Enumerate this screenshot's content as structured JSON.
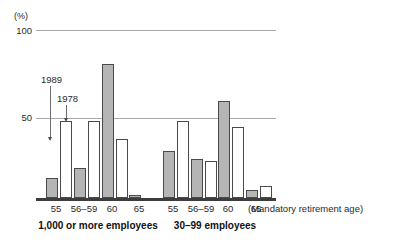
{
  "chart_data": {
    "type": "bar",
    "title": "",
    "subtitle": "",
    "xlabel": "(Mandatory retirement age)",
    "ylabel": "(%)",
    "ylim": [
      0,
      100
    ],
    "yticks": [
      50,
      100
    ],
    "ytick_labels": [
      "50",
      "100"
    ],
    "grid": true,
    "legend_position": "inline-annotation",
    "categories": [
      "55",
      "56–59",
      "60",
      "65"
    ],
    "groups": [
      {
        "name": "1,000 or more employees",
        "series": [
          {
            "name": "1989",
            "style": "gray",
            "values": [
              12,
              18,
              80,
              2
            ]
          },
          {
            "name": "1978",
            "style": "white",
            "values": [
              46,
              46,
              35,
              0
            ]
          }
        ]
      },
      {
        "name": "30–99 employees",
        "series": [
          {
            "name": "1989",
            "style": "gray",
            "values": [
              28,
              23,
              58,
              5
            ]
          },
          {
            "name": "1978",
            "style": "white",
            "values": [
              46,
              22,
              42,
              7
            ]
          }
        ]
      }
    ],
    "annotations": [
      {
        "label": "1989",
        "points_to": "gray-bar-age-55-group-1"
      },
      {
        "label": "1978",
        "points_to": "white-bar-age-55-group-1"
      }
    ],
    "colors": {
      "series_1989_fill": "#b5b5b5",
      "series_1978_fill": "#ffffff",
      "bar_outline": "#4a4a4a",
      "gridline": "#a9a9a9",
      "baseline": "#3d3d3d",
      "text": "#2a2a2a"
    }
  },
  "axis": {
    "unit_label": "(%)",
    "ytick_100": "100",
    "ytick_50": "50",
    "note": "(Mandatory retirement age)"
  },
  "annotations": {
    "a1989": "1989",
    "a1978": "1978"
  },
  "xticks_group1": [
    "55",
    "56–59",
    "60",
    "65"
  ],
  "xticks_group2": [
    "55",
    "56–59",
    "60",
    "65"
  ],
  "captions": {
    "group1": "1,000 or more employees",
    "group2": "30–99 employees"
  }
}
